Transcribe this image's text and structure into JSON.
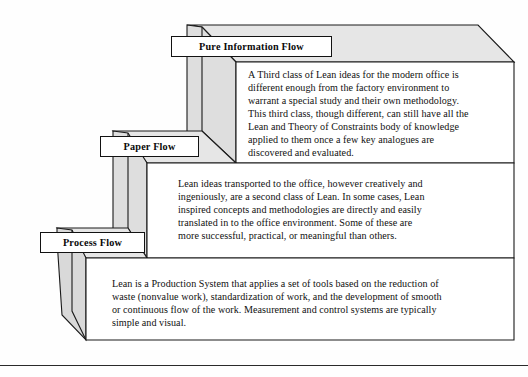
{
  "diagram": {
    "title_text": "",
    "background_color": "#fefefe",
    "line_color": "#1a1a1a",
    "top_face_color": "#e6e6e6",
    "side_face_color": "#d9d9d9",
    "panel_color": "#ffffff",
    "steps": [
      {
        "id": "step-top",
        "label": "Pure Information Flow",
        "body": "A Third class of Lean ideas for the modern office is\ndifferent enough from the factory environment to\nwarrant a special study and their own methodology.\nThis third class, though different, can still have all the\nLean and Theory of Constraints body of knowledge\napplied to them once a few key analogues are\ndiscovered and evaluated."
      },
      {
        "id": "step-middle",
        "label": "Paper Flow",
        "body": "Lean ideas transported to the office, however creatively and\ningeniously, are a second class of Lean. In some cases, Lean\ninspired concepts and methodologies are directly and easily\ntranslated in to the office environment. Some of these are\nmore successful, practical, or meaningful than others."
      },
      {
        "id": "step-bottom",
        "label": "Process Flow",
        "body": "Lean is a Production System that applies a set of tools based on the reduction of\nwaste (nonvalue work), standardization of work, and the development of smooth\nor continuous flow of the work. Measurement and control systems are typically\nsimple and visual."
      }
    ]
  }
}
